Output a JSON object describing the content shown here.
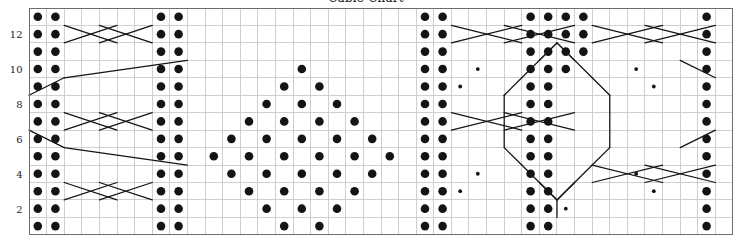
{
  "title": "Cable Chart",
  "axis": {
    "row_labels": [
      {
        "row": 2,
        "text": "2"
      },
      {
        "row": 4,
        "text": "4"
      },
      {
        "row": 6,
        "text": "6"
      },
      {
        "row": 8,
        "text": "8"
      },
      {
        "row": 10,
        "text": "10"
      },
      {
        "row": 12,
        "text": "12"
      }
    ]
  },
  "colors": {
    "grid_minor": "#c9c9c9",
    "grid_major": "#8f8f8f",
    "border": "#6e6e6e",
    "symbol": "#141414",
    "cable_line": "#141414",
    "label": "#222222",
    "background": "#ffffff"
  },
  "chart_data": {
    "type": "heatmap",
    "title": "Cable Chart",
    "xlabel": "",
    "ylabel": "",
    "grid": true,
    "legend": null,
    "columns": 40,
    "rows": 13,
    "xlim": [
      0,
      40
    ],
    "ylim": [
      0,
      13
    ],
    "cell_w": 17.6,
    "cell_h": 17.45,
    "origin": {
      "x": 28.5,
      "y": 8.0
    },
    "row_order": "bottom_to_top",
    "tick_labels_y": [
      "2",
      "4",
      "6",
      "8",
      "10",
      "12"
    ],
    "symbol_legend": [
      {
        "name": "knit-dot",
        "glyph": "filled-circle",
        "size": 4.3
      },
      {
        "name": "twist-dot",
        "glyph": "small-filled-circle",
        "size": 1.9
      },
      {
        "name": "cable-cross",
        "glyph": "diagonal-line"
      }
    ],
    "dots": [
      {
        "r": 13,
        "cols": [
          1,
          2,
          8,
          9,
          23,
          24,
          29,
          30,
          31,
          32,
          39
        ]
      },
      {
        "r": 12,
        "cols": [
          1,
          2,
          8,
          9,
          23,
          24,
          29,
          30,
          31,
          32,
          39
        ]
      },
      {
        "r": 11,
        "cols": [
          1,
          2,
          8,
          9,
          23,
          24,
          29,
          30,
          31,
          32,
          39
        ]
      },
      {
        "r": 10,
        "cols": [
          1,
          2,
          8,
          9,
          16,
          23,
          24,
          29,
          30,
          31,
          39
        ]
      },
      {
        "r": 9,
        "cols": [
          1,
          2,
          8,
          9,
          15,
          17,
          23,
          24,
          29,
          30,
          39
        ]
      },
      {
        "r": 8,
        "cols": [
          1,
          2,
          8,
          9,
          14,
          16,
          18,
          23,
          24,
          29,
          30,
          39
        ]
      },
      {
        "r": 7,
        "cols": [
          1,
          2,
          8,
          9,
          13,
          15,
          17,
          19,
          23,
          24,
          29,
          30,
          39
        ]
      },
      {
        "r": 6,
        "cols": [
          1,
          2,
          8,
          9,
          12,
          14,
          16,
          18,
          20,
          23,
          24,
          29,
          30,
          39
        ]
      },
      {
        "r": 5,
        "cols": [
          1,
          2,
          8,
          9,
          11,
          13,
          15,
          17,
          19,
          21,
          23,
          24,
          29,
          30,
          39
        ]
      },
      {
        "r": 4,
        "cols": [
          1,
          2,
          8,
          9,
          12,
          14,
          16,
          18,
          20,
          23,
          24,
          29,
          30,
          39
        ]
      },
      {
        "r": 3,
        "cols": [
          1,
          2,
          8,
          9,
          13,
          15,
          17,
          19,
          23,
          24,
          29,
          30,
          39
        ]
      },
      {
        "r": 2,
        "cols": [
          1,
          2,
          8,
          9,
          14,
          16,
          18,
          23,
          24,
          29,
          30,
          39
        ]
      },
      {
        "r": 1,
        "cols": [
          1,
          2,
          8,
          9,
          15,
          17,
          23,
          24,
          29,
          30,
          39
        ]
      }
    ],
    "small_dots": [
      {
        "r": 10,
        "cols": [
          26,
          35
        ]
      },
      {
        "r": 9,
        "cols": [
          25,
          36
        ]
      },
      {
        "r": 4,
        "cols": [
          26,
          35
        ]
      },
      {
        "r": 3,
        "cols": [
          25,
          36
        ]
      },
      {
        "r": 2,
        "cols": [
          30,
          31
        ]
      }
    ],
    "cables": [
      {
        "row": 12,
        "c1": 3,
        "c2": 6
      },
      {
        "row": 12,
        "c1": 5,
        "c2": 8
      },
      {
        "row": 12,
        "c1": 25,
        "c2": 29
      },
      {
        "row": 12,
        "c1": 28,
        "c2": 32
      },
      {
        "row": 12,
        "c1": 33,
        "c2": 37
      },
      {
        "row": 12,
        "c1": 36,
        "c2": 40
      },
      {
        "row": 7,
        "c1": 3,
        "c2": 6
      },
      {
        "row": 7,
        "c1": 5,
        "c2": 8
      },
      {
        "row": 7,
        "c1": 25,
        "c2": 29
      },
      {
        "row": 7,
        "c1": 28,
        "c2": 32
      },
      {
        "row": 3,
        "c1": 3,
        "c2": 6
      },
      {
        "row": 3,
        "c1": 5,
        "c2": 8
      },
      {
        "row": 4,
        "c1": 33,
        "c2": 37
      },
      {
        "row": 4,
        "c1": 36,
        "c2": 40
      }
    ],
    "diamond_outline": {
      "description": "central diamond motif formed by diagonal travelling-stitch lines",
      "apex_top": {
        "row": 11,
        "col": 31
      },
      "apex_bottom": {
        "row": 1,
        "col": 31
      }
    }
  }
}
